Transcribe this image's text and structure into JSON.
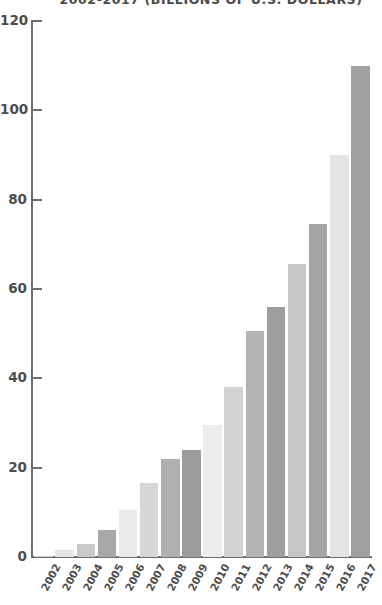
{
  "chart_data": {
    "type": "bar",
    "title": "2002-2017 (BILLIONS OF U.S. DOLLARS)",
    "xlabel": "",
    "ylabel": "",
    "ylim": [
      0,
      120
    ],
    "yticks": [
      0,
      20,
      40,
      60,
      80,
      100,
      120
    ],
    "ytick_labels": [
      "0",
      "20",
      "40",
      "60",
      "80",
      "100",
      "120"
    ],
    "grid": false,
    "legend": "none",
    "categories": [
      "2002",
      "2003",
      "2004",
      "2005",
      "2006",
      "2007",
      "2008",
      "2009",
      "2010",
      "2011",
      "2012",
      "2013",
      "2014",
      "2015",
      "2016",
      "2017"
    ],
    "values": [
      0.3,
      1.5,
      3.0,
      6.0,
      10.5,
      16.5,
      22.0,
      24.0,
      29.5,
      38.0,
      50.5,
      56.0,
      65.5,
      74.5,
      90.0,
      110.0
    ],
    "bar_colors": [
      "#d0d0d0",
      "#e6e6e6",
      "#c9c9c9",
      "#a8a8a8",
      "#eaeaea",
      "#d6d6d6",
      "#b0b0b0",
      "#9c9c9c",
      "#ececec",
      "#d2d2d2",
      "#b4b4b4",
      "#9e9e9e",
      "#c6c6c6",
      "#a6a6a6",
      "#e4e4e4",
      "#a0a0a0"
    ],
    "axis_color": "#6e6e6e",
    "text_color": "#4d4d4d",
    "background": "#ffffff"
  }
}
